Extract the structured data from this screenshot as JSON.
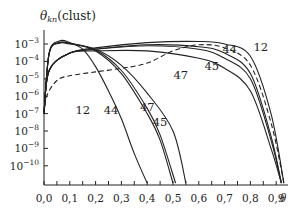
{
  "chart_data": {
    "type": "line",
    "ylabel": "θ_kn (clust)",
    "xlabel": "θ",
    "yscale": "log",
    "xlim": [
      0.0,
      0.95
    ],
    "ylim": [
      1e-11,
      0.003
    ],
    "grid": false,
    "legend": "inline curve labels",
    "x_ticks": [
      "0,0",
      "0,1",
      "0,2",
      "0,3",
      "0,4",
      "0,5",
      "0,6",
      "0,7",
      "0,8",
      "0,9"
    ],
    "y_ticks": [
      {
        "base": "10",
        "exp": "−3",
        "value": 0.001
      },
      {
        "base": "10",
        "exp": "−4",
        "value": 0.0001
      },
      {
        "base": "10",
        "exp": "−5",
        "value": 1e-05
      },
      {
        "base": "10",
        "exp": "−6",
        "value": 1e-06
      },
      {
        "base": "10",
        "exp": "−7",
        "value": 1e-07
      },
      {
        "base": "10",
        "exp": "−8",
        "value": 1e-08
      },
      {
        "base": "10",
        "exp": "−9",
        "value": 1e-09
      },
      {
        "base": "10",
        "exp": "−10",
        "value": 1e-10
      }
    ],
    "series": [
      {
        "name": "12 (decreasing)",
        "style": "solid",
        "x": [
          0.0,
          0.02,
          0.06,
          0.1,
          0.15,
          0.2,
          0.25,
          0.3,
          0.35,
          0.4
        ],
        "y": [
          1e-07,
          0.0003,
          0.0015,
          0.0012,
          0.0005,
          5e-05,
          2e-06,
          5e-08,
          5e-10,
          1e-11
        ]
      },
      {
        "name": "44 (decreasing)",
        "style": "solid",
        "x": [
          0.0,
          0.02,
          0.06,
          0.1,
          0.2,
          0.3,
          0.4,
          0.45,
          0.5
        ],
        "y": [
          1e-07,
          0.0003,
          0.0012,
          0.0011,
          0.0004,
          2e-05,
          1e-07,
          3e-09,
          1e-11
        ]
      },
      {
        "name": "45 (decreasing)",
        "style": "solid",
        "x": [
          0.0,
          0.02,
          0.06,
          0.1,
          0.2,
          0.3,
          0.4,
          0.45,
          0.51
        ],
        "y": [
          1e-07,
          0.0003,
          0.0012,
          0.0011,
          0.00045,
          3e-05,
          2e-07,
          6e-09,
          1e-11
        ]
      },
      {
        "name": "47 (decreasing)",
        "style": "solid",
        "x": [
          0.0,
          0.02,
          0.06,
          0.1,
          0.2,
          0.3,
          0.4,
          0.5,
          0.55
        ],
        "y": [
          1e-07,
          0.0003,
          0.0011,
          0.001,
          0.0005,
          6e-05,
          1.5e-06,
          1e-08,
          1e-11
        ]
      },
      {
        "name": "12 (increasing)",
        "style": "solid",
        "x": [
          0.0,
          0.02,
          0.1,
          0.2,
          0.4,
          0.6,
          0.7,
          0.8,
          0.88,
          0.93
        ],
        "y": [
          1e-07,
          3e-05,
          0.0003,
          0.0006,
          0.0012,
          0.0014,
          0.001,
          0.0002,
          1e-07,
          1e-11
        ]
      },
      {
        "name": "44 (increasing)",
        "style": "solid",
        "x": [
          0.0,
          0.02,
          0.1,
          0.2,
          0.4,
          0.6,
          0.7,
          0.8,
          0.88,
          0.92
        ],
        "y": [
          1e-07,
          3e-05,
          0.0003,
          0.0005,
          0.0009,
          0.0007,
          0.0003,
          2e-05,
          5e-09,
          1e-11
        ]
      },
      {
        "name": "45 (increasing)",
        "style": "solid",
        "x": [
          0.0,
          0.02,
          0.1,
          0.2,
          0.4,
          0.6,
          0.7,
          0.8,
          0.88,
          0.92
        ],
        "y": [
          1e-07,
          3e-05,
          0.0003,
          0.0005,
          0.0008,
          0.0005,
          0.00015,
          1e-05,
          3e-09,
          1e-11
        ]
      },
      {
        "name": "47 (increasing)",
        "style": "solid",
        "x": [
          0.0,
          0.02,
          0.1,
          0.2,
          0.4,
          0.6,
          0.7,
          0.8,
          0.88,
          0.92
        ],
        "y": [
          1e-07,
          3e-05,
          0.0003,
          0.0004,
          0.0004,
          0.00015,
          4e-05,
          2e-06,
          1e-09,
          1e-11
        ]
      },
      {
        "name": "dashed",
        "style": "dashed",
        "x": [
          0.0,
          0.01,
          0.05,
          0.1,
          0.2,
          0.3,
          0.4,
          0.5,
          0.6,
          0.7,
          0.8,
          0.88,
          0.93
        ],
        "y": [
          1e-07,
          1e-06,
          8e-06,
          1.5e-05,
          2.5e-05,
          4e-05,
          8e-05,
          0.0004,
          0.0009,
          0.0006,
          6e-05,
          3e-08,
          1e-11
        ]
      }
    ],
    "annotations": [
      {
        "text": "12",
        "x": 0.15,
        "y": 1e-07
      },
      {
        "text": "44",
        "x": 0.26,
        "y": 1e-07
      },
      {
        "text": "45",
        "x": 0.45,
        "y": 2e-08
      },
      {
        "text": "47",
        "x": 0.4,
        "y": 1.5e-07
      },
      {
        "text": "47",
        "x": 0.53,
        "y": 1e-05
      },
      {
        "text": "45",
        "x": 0.65,
        "y": 3e-05
      },
      {
        "text": "44",
        "x": 0.72,
        "y": 0.0003
      },
      {
        "text": "12",
        "x": 0.84,
        "y": 0.0004
      }
    ]
  },
  "axes": {
    "y_title": {
      "main": "θ",
      "sub": "kn",
      "suffix": "(clust)"
    },
    "x_title": "θ"
  }
}
